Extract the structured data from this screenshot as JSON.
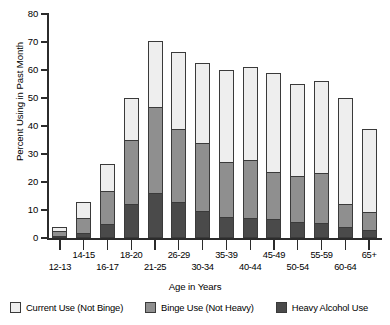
{
  "chart_data": {
    "type": "bar",
    "stacked": true,
    "title": "",
    "xlabel": "Age in Years",
    "ylabel": "Percent Using in Past Month",
    "ylim": [
      0,
      80
    ],
    "yticks": [
      0,
      10,
      20,
      30,
      40,
      50,
      60,
      70,
      80
    ],
    "grid": false,
    "legend_position": "bottom",
    "categories": [
      "12-13",
      "14-15",
      "16-17",
      "18-20",
      "21-25",
      "26-29",
      "30-34",
      "35-39",
      "40-44",
      "45-49",
      "50-54",
      "55-59",
      "60-64",
      "65+"
    ],
    "series": [
      {
        "name": "Heavy Alcohol Use",
        "color": "#4a4a4a",
        "values": [
          0.6,
          1.5,
          4.8,
          12.0,
          16.0,
          12.5,
          9.5,
          7.2,
          7.0,
          6.5,
          5.5,
          5.0,
          3.5,
          2.5
        ]
      },
      {
        "name": "Binge Use (Not Heavy)",
        "color": "#8f8f8f",
        "values": [
          1.8,
          5.5,
          12.2,
          23.0,
          31.0,
          26.5,
          24.5,
          19.8,
          21.0,
          17.0,
          16.5,
          18.0,
          8.5,
          6.5
        ]
      },
      {
        "name": "Current Use (Not Binge)",
        "color": "#eeeeee",
        "values": [
          1.6,
          6.0,
          9.5,
          15.0,
          23.5,
          27.5,
          28.5,
          33.0,
          33.0,
          35.5,
          33.0,
          33.0,
          38.0,
          30.0
        ]
      }
    ],
    "totals": [
      4.0,
      13.0,
      26.5,
      50.0,
      70.5,
      66.5,
      62.5,
      60.0,
      61.0,
      59.0,
      55.0,
      56.0,
      50.0,
      39.0
    ]
  },
  "legend": {
    "items": [
      {
        "label": "Current Use (Not Binge)",
        "color": "#eeeeee",
        "key": "current"
      },
      {
        "label": "Binge Use (Not Heavy)",
        "color": "#8f8f8f",
        "key": "binge"
      },
      {
        "label": "Heavy Alcohol Use",
        "color": "#4a4a4a",
        "key": "heavy"
      }
    ]
  }
}
